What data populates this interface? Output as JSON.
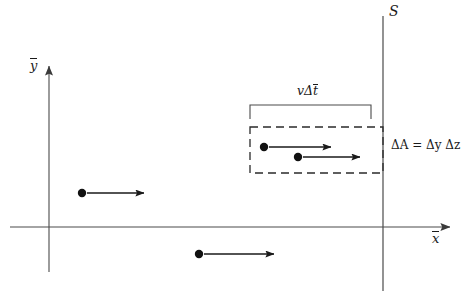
{
  "figure": {
    "background_color": "#ffffff",
    "line_color": "#1a1a1a",
    "axes": {
      "y_label": "y",
      "y_label_overbar": true,
      "x_label": "x",
      "x_label_overbar": true,
      "origin_x": 49,
      "origin_y": 227
    },
    "surface": {
      "label": "S",
      "label_style": "script",
      "x_position": 383
    },
    "bracket": {
      "label_v": "v",
      "label_delta": "Δ",
      "label_t": "t",
      "label_t_overbar": true,
      "full_label": "vΔt̄",
      "left": 250,
      "right": 371,
      "top": 105
    },
    "dashed_box": {
      "left": 250,
      "right": 383,
      "top": 127,
      "bottom": 173,
      "dash_pattern": "8 5"
    },
    "area_label": {
      "delta_a": "ΔA",
      "equals": "=",
      "delta_y": "Δy",
      "delta_z": "Δz",
      "full_label": "ΔA = Δy Δz"
    },
    "particles": [
      {
        "id": "particle-in-box-upper",
        "cx": 264,
        "cy": 147,
        "arrow_end_x": 331,
        "radius": 4.2,
        "inside_box": true
      },
      {
        "id": "particle-in-box-lower",
        "cx": 298,
        "cy": 157,
        "arrow_end_x": 360,
        "radius": 4.2,
        "inside_box": true
      },
      {
        "id": "particle-left",
        "cx": 82,
        "cy": 193,
        "arrow_end_x": 144,
        "radius": 4.2,
        "inside_box": false
      },
      {
        "id": "particle-below-axis",
        "cx": 199,
        "cy": 254,
        "arrow_end_x": 274,
        "radius": 4.2,
        "inside_box": false
      }
    ]
  }
}
